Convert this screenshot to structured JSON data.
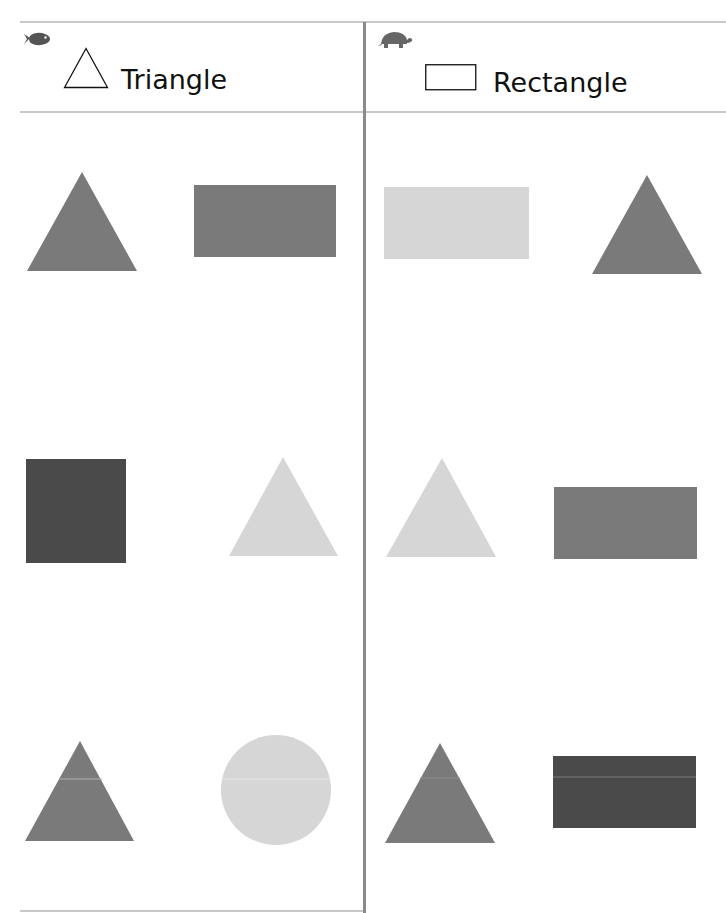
{
  "worksheet": {
    "columns": [
      {
        "id": "triangle",
        "label": "Triangle",
        "mascot_icon": "fish-icon",
        "header_icon": "triangle-outline-icon"
      },
      {
        "id": "rectangle",
        "label": "Rectangle",
        "mascot_icon": "turtle-icon",
        "header_icon": "rectangle-outline-icon"
      }
    ],
    "colors": {
      "dark": "#4a4a4a",
      "medium": "#7a7a7a",
      "light": "#d6d6d6",
      "rule": "#c8c8c8",
      "divider": "#8a8a8a",
      "mascot": "#555555"
    },
    "shapes": [
      {
        "column": "triangle",
        "row": 1,
        "shape": "triangle",
        "shade": "medium"
      },
      {
        "column": "triangle",
        "row": 1,
        "shape": "rectangle",
        "shade": "medium"
      },
      {
        "column": "triangle",
        "row": 2,
        "shape": "square",
        "shade": "dark"
      },
      {
        "column": "triangle",
        "row": 2,
        "shape": "triangle",
        "shade": "light"
      },
      {
        "column": "triangle",
        "row": 3,
        "shape": "triangle",
        "shade": "medium"
      },
      {
        "column": "triangle",
        "row": 3,
        "shape": "circle",
        "shade": "light"
      },
      {
        "column": "rectangle",
        "row": 1,
        "shape": "rectangle",
        "shade": "light"
      },
      {
        "column": "rectangle",
        "row": 1,
        "shape": "triangle",
        "shade": "medium"
      },
      {
        "column": "rectangle",
        "row": 2,
        "shape": "triangle",
        "shade": "light"
      },
      {
        "column": "rectangle",
        "row": 2,
        "shape": "rectangle",
        "shade": "medium"
      },
      {
        "column": "rectangle",
        "row": 3,
        "shape": "triangle",
        "shade": "medium"
      },
      {
        "column": "rectangle",
        "row": 3,
        "shape": "rectangle",
        "shade": "dark"
      }
    ]
  }
}
